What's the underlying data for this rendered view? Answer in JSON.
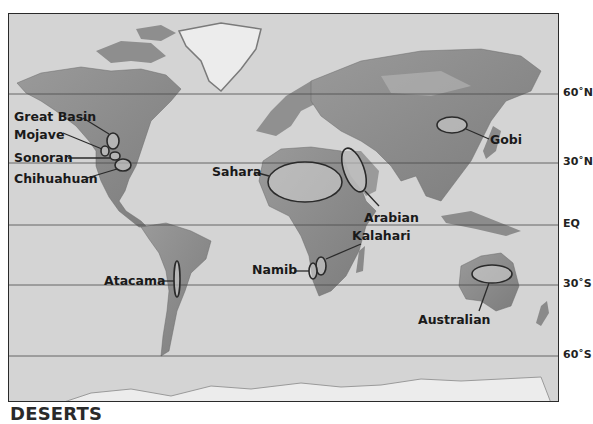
{
  "title": "DESERTS",
  "latitude_lines": [
    {
      "label": "60˚N",
      "y": 93
    },
    {
      "label": "30˚N",
      "y": 162
    },
    {
      "label": "EQ",
      "y": 224
    },
    {
      "label": "30˚S",
      "y": 284
    },
    {
      "label": "60˚S",
      "y": 355
    }
  ],
  "deserts": [
    {
      "name": "Great Basin"
    },
    {
      "name": "Mojave"
    },
    {
      "name": "Sonoran"
    },
    {
      "name": "Chihuahuan"
    },
    {
      "name": "Sahara"
    },
    {
      "name": "Arabian"
    },
    {
      "name": "Gobi"
    },
    {
      "name": "Kalahari"
    },
    {
      "name": "Namib"
    },
    {
      "name": "Atacama"
    },
    {
      "name": "Australian"
    }
  ],
  "colors": {
    "ocean": "#d4d4d4",
    "land": "#8a8a8a",
    "ice": "#ececec",
    "outline": "#2a2a2a"
  }
}
